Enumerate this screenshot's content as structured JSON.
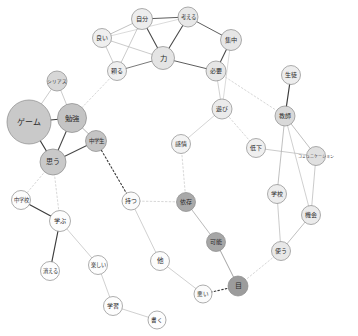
{
  "chart_data": {
    "type": "network",
    "title": "",
    "xlabel": "",
    "ylabel": "",
    "background": "#ffffff",
    "node_fill_levels": {
      "white": "#fefefe",
      "pale": "#f2f2f2",
      "light": "#e2e2e2",
      "medium": "#c9c9c9",
      "dark": "#9f9f9f",
      "darker": "#8c8c8c"
    },
    "edge_colors": {
      "black": "#2a2a2a",
      "gray": "#9a9a9a",
      "light": "#c2c2c2"
    },
    "nodes": [
      {
        "id": "yoi",
        "label": "良い",
        "x": 102,
        "y": 38,
        "r": 9.5,
        "fill": "#efefef",
        "fs": 6.0
      },
      {
        "id": "jibun",
        "label": "自分",
        "x": 142,
        "y": 19,
        "r": 10.5,
        "fill": "#ededed",
        "fs": 6.2
      },
      {
        "id": "kangaeru",
        "label": "考える",
        "x": 188,
        "y": 17,
        "r": 10.0,
        "fill": "#e8e8e8",
        "fs": 5.4
      },
      {
        "id": "shuuchuu",
        "label": "集中",
        "x": 231,
        "y": 40,
        "r": 10.5,
        "fill": "#e6e6e6",
        "fs": 6.2
      },
      {
        "id": "chikara",
        "label": "力",
        "x": 163,
        "y": 58,
        "r": 11.5,
        "fill": "#e4e4e4",
        "fs": 7.4
      },
      {
        "id": "tayoru",
        "label": "頼る",
        "x": 117,
        "y": 71,
        "r": 9.5,
        "fill": "#efefef",
        "fs": 6.0
      },
      {
        "id": "hitsuyou",
        "label": "必要",
        "x": 216,
        "y": 71,
        "r": 10.0,
        "fill": "#e6e6e6",
        "fs": 6.0
      },
      {
        "id": "asobi",
        "label": "遊び",
        "x": 222,
        "y": 109,
        "r": 10.0,
        "fill": "#ebebeb",
        "fs": 6.0
      },
      {
        "id": "kanjou",
        "label": "感情",
        "x": 181,
        "y": 144,
        "r": 9.5,
        "fill": "#f3f3f3",
        "fs": 6.0
      },
      {
        "id": "teika",
        "label": "低下",
        "x": 256,
        "y": 148,
        "r": 9.5,
        "fill": "#efefef",
        "fs": 6.0
      },
      {
        "id": "seito",
        "label": "生徒",
        "x": 291,
        "y": 75,
        "r": 9.5,
        "fill": "#ededed",
        "fs": 6.0
      },
      {
        "id": "kyoushi",
        "label": "教師",
        "x": 285,
        "y": 116,
        "r": 10.0,
        "fill": "#d9d9d9",
        "fs": 6.0
      },
      {
        "id": "comm",
        "label": "コミュニケーション",
        "x": 316,
        "y": 156,
        "r": 9.5,
        "fill": "#e0e0e0",
        "fs": 4.0
      },
      {
        "id": "gakkou2",
        "label": "学校",
        "x": 277,
        "y": 194,
        "r": 9.5,
        "fill": "#ededed",
        "fs": 6.0
      },
      {
        "id": "kikai",
        "label": "機会",
        "x": 311,
        "y": 215,
        "r": 9.5,
        "fill": "#ebebeb",
        "fs": 6.0
      },
      {
        "id": "tsukau",
        "label": "使う",
        "x": 281,
        "y": 251,
        "r": 9.5,
        "fill": "#e8e8e8",
        "fs": 6.0
      },
      {
        "id": "me",
        "label": "目",
        "x": 238,
        "y": 286,
        "r": 10.0,
        "fill": "#9c9c9c",
        "fs": 7.0
      },
      {
        "id": "warui",
        "label": "悪い",
        "x": 203,
        "y": 294,
        "r": 9.0,
        "fill": "#fbfbfb",
        "fs": 5.6
      },
      {
        "id": "kanou",
        "label": "可能",
        "x": 216,
        "y": 242,
        "r": 9.5,
        "fill": "#a6a6a6",
        "fs": 6.0
      },
      {
        "id": "izon",
        "label": "依存",
        "x": 186,
        "y": 202,
        "r": 9.5,
        "fill": "#a9a9a9",
        "fs": 6.0
      },
      {
        "id": "motsu",
        "label": "持つ",
        "x": 131,
        "y": 201,
        "r": 9.0,
        "fill": "#fbfbfb",
        "fs": 5.8
      },
      {
        "id": "hoka",
        "label": "他",
        "x": 160,
        "y": 261,
        "r": 9.5,
        "fill": "#fcfcfc",
        "fs": 6.6
      },
      {
        "id": "chuugakusei",
        "label": "中学生",
        "x": 96,
        "y": 141,
        "r": 10.5,
        "fill": "#c4c4c4",
        "fs": 5.4
      },
      {
        "id": "omou",
        "label": "思う",
        "x": 53,
        "y": 162,
        "r": 13.0,
        "fill": "#c9c9c9",
        "fs": 7.0
      },
      {
        "id": "benkyou",
        "label": "勉強",
        "x": 72,
        "y": 118,
        "r": 14.5,
        "fill": "#c4c4c4",
        "fs": 7.4
      },
      {
        "id": "game",
        "label": "ゲーム",
        "x": 29,
        "y": 122,
        "r": 22.0,
        "fill": "#c9c9c9",
        "fs": 8.0
      },
      {
        "id": "serious",
        "label": "シリアス",
        "x": 57,
        "y": 81,
        "r": 10.0,
        "fill": "#d7d7d7",
        "fs": 4.6
      },
      {
        "id": "chuugakkou",
        "label": "中学校",
        "x": 21,
        "y": 200,
        "r": 9.5,
        "fill": "#fcfcfc",
        "fs": 5.2
      },
      {
        "id": "manabu",
        "label": "学ぶ",
        "x": 60,
        "y": 221,
        "r": 10.5,
        "fill": "#fdfdfd",
        "fs": 6.2
      },
      {
        "id": "kieru",
        "label": "消える",
        "x": 50,
        "y": 271,
        "r": 9.5,
        "fill": "#fdfdfd",
        "fs": 5.2
      },
      {
        "id": "tanoshii",
        "label": "楽しい",
        "x": 98,
        "y": 265,
        "r": 9.5,
        "fill": "#fdfdfd",
        "fs": 5.2
      },
      {
        "id": "gakushuu",
        "label": "学習",
        "x": 113,
        "y": 306,
        "r": 9.5,
        "fill": "#fdfdfd",
        "fs": 6.0
      },
      {
        "id": "kaku",
        "label": "書く",
        "x": 157,
        "y": 320,
        "r": 9.0,
        "fill": "#fdfdfd",
        "fs": 5.6
      }
    ],
    "edges": [
      {
        "from": "yoi",
        "to": "jibun",
        "style": "solid",
        "color": "#a8a8a8",
        "w": 0.7
      },
      {
        "from": "yoi",
        "to": "chikara",
        "style": "solid",
        "color": "#b5b5b5",
        "w": 0.7
      },
      {
        "from": "yoi",
        "to": "tayoru",
        "style": "solid",
        "color": "#b5b5b5",
        "w": 0.7
      },
      {
        "from": "yoi",
        "to": "kangaeru",
        "style": "solid",
        "color": "#c2c2c2",
        "w": 0.6
      },
      {
        "from": "jibun",
        "to": "kangaeru",
        "style": "solid",
        "color": "#5d5d5d",
        "w": 1.0
      },
      {
        "from": "jibun",
        "to": "chikara",
        "style": "solid",
        "color": "#4a4a4a",
        "w": 1.1
      },
      {
        "from": "jibun",
        "to": "tayoru",
        "style": "solid",
        "color": "#b5b5b5",
        "w": 0.7
      },
      {
        "from": "kangaeru",
        "to": "chikara",
        "style": "solid",
        "color": "#4a4a4a",
        "w": 1.1
      },
      {
        "from": "kangaeru",
        "to": "shuuchuu",
        "style": "solid",
        "color": "#5d5d5d",
        "w": 1.0
      },
      {
        "from": "shuuchuu",
        "to": "hitsuyou",
        "style": "solid",
        "color": "#4a4a4a",
        "w": 1.1
      },
      {
        "from": "shuuchuu",
        "to": "asobi",
        "style": "solid",
        "color": "#c2c2c2",
        "w": 0.6
      },
      {
        "from": "chikara",
        "to": "tayoru",
        "style": "solid",
        "color": "#6a6a6a",
        "w": 0.9
      },
      {
        "from": "chikara",
        "to": "hitsuyou",
        "style": "solid",
        "color": "#5d5d5d",
        "w": 1.0
      },
      {
        "from": "hitsuyou",
        "to": "asobi",
        "style": "solid",
        "color": "#bcbcbc",
        "w": 0.7
      },
      {
        "from": "hitsuyou",
        "to": "kyoushi",
        "style": "dotted",
        "color": "#cdcdcd",
        "w": 0.8
      },
      {
        "from": "tayoru",
        "to": "benkyou",
        "style": "dotted",
        "color": "#cdcdcd",
        "w": 0.8
      },
      {
        "from": "asobi",
        "to": "kanjou",
        "style": "solid",
        "color": "#c2c2c2",
        "w": 0.7
      },
      {
        "from": "asobi",
        "to": "teika",
        "style": "dotted",
        "color": "#cdcdcd",
        "w": 0.8
      },
      {
        "from": "kanjou",
        "to": "izon",
        "style": "dotted",
        "color": "#cdcdcd",
        "w": 0.8
      },
      {
        "from": "teika",
        "to": "comm",
        "style": "solid",
        "color": "#b5b5b5",
        "w": 0.7
      },
      {
        "from": "seito",
        "to": "kyoushi",
        "style": "solid",
        "color": "#3c3c3c",
        "w": 1.2
      },
      {
        "from": "kyoushi",
        "to": "comm",
        "style": "solid",
        "color": "#b0b0b0",
        "w": 0.8
      },
      {
        "from": "kyoushi",
        "to": "gakkou2",
        "style": "solid",
        "color": "#b0b0b0",
        "w": 0.8
      },
      {
        "from": "kyoushi",
        "to": "kikai",
        "style": "solid",
        "color": "#bcbcbc",
        "w": 0.7
      },
      {
        "from": "comm",
        "to": "kikai",
        "style": "solid",
        "color": "#b5b5b5",
        "w": 0.7
      },
      {
        "from": "gakkou2",
        "to": "tsukau",
        "style": "solid",
        "color": "#b5b5b5",
        "w": 0.7
      },
      {
        "from": "kikai",
        "to": "tsukau",
        "style": "solid",
        "color": "#b0b0b0",
        "w": 0.8
      },
      {
        "from": "tsukau",
        "to": "me",
        "style": "dotted",
        "color": "#cdcdcd",
        "w": 0.8
      },
      {
        "from": "me",
        "to": "warui",
        "style": "dotted",
        "color": "#3a3a3a",
        "w": 1.1
      },
      {
        "from": "me",
        "to": "kanou",
        "style": "solid",
        "color": "#9a9a9a",
        "w": 0.9
      },
      {
        "from": "kanou",
        "to": "izon",
        "style": "solid",
        "color": "#a8a8a8",
        "w": 0.8
      },
      {
        "from": "izon",
        "to": "motsu",
        "style": "dotted",
        "color": "#cdcdcd",
        "w": 0.8
      },
      {
        "from": "motsu",
        "to": "chuugakusei",
        "style": "dotted",
        "color": "#3a3a3a",
        "w": 1.1
      },
      {
        "from": "motsu",
        "to": "hoka",
        "style": "solid",
        "color": "#bcbcbc",
        "w": 0.7
      },
      {
        "from": "hoka",
        "to": "warui",
        "style": "solid",
        "color": "#bcbcbc",
        "w": 0.7
      },
      {
        "from": "chuugakusei",
        "to": "benkyou",
        "style": "solid",
        "color": "#a0a0a0",
        "w": 0.8
      },
      {
        "from": "chuugakusei",
        "to": "omou",
        "style": "solid",
        "color": "#4a4a4a",
        "w": 1.1
      },
      {
        "from": "benkyou",
        "to": "game",
        "style": "solid",
        "color": "#3c3c3c",
        "w": 1.2
      },
      {
        "from": "benkyou",
        "to": "omou",
        "style": "solid",
        "color": "#4a4a4a",
        "w": 1.1
      },
      {
        "from": "benkyou",
        "to": "serious",
        "style": "solid",
        "color": "#b5b5b5",
        "w": 0.7
      },
      {
        "from": "game",
        "to": "omou",
        "style": "solid",
        "color": "#3c3c3c",
        "w": 1.2
      },
      {
        "from": "game",
        "to": "serious",
        "style": "solid",
        "color": "#b5b5b5",
        "w": 0.7
      },
      {
        "from": "omou",
        "to": "chuugakkou",
        "style": "dotted",
        "color": "#cdcdcd",
        "w": 0.8
      },
      {
        "from": "omou",
        "to": "manabu",
        "style": "dotted",
        "color": "#cdcdcd",
        "w": 0.8
      },
      {
        "from": "chuugakkou",
        "to": "manabu",
        "style": "solid",
        "color": "#3c3c3c",
        "w": 1.2
      },
      {
        "from": "manabu",
        "to": "kieru",
        "style": "solid",
        "color": "#3c3c3c",
        "w": 1.2
      },
      {
        "from": "manabu",
        "to": "tanoshii",
        "style": "solid",
        "color": "#bcbcbc",
        "w": 0.7
      },
      {
        "from": "tanoshii",
        "to": "gakushuu",
        "style": "solid",
        "color": "#bcbcbc",
        "w": 0.7
      },
      {
        "from": "gakushuu",
        "to": "kaku",
        "style": "solid",
        "color": "#bcbcbc",
        "w": 0.7
      }
    ]
  }
}
